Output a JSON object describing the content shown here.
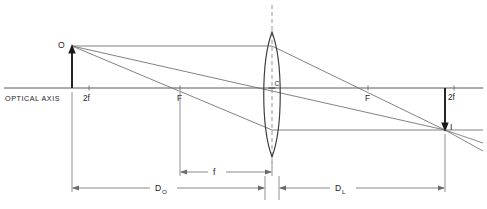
{
  "diagram": {
    "type": "optics-ray-diagram",
    "canvas": {
      "width": 487,
      "height": 209
    },
    "colors": {
      "line": "#5a5a5a",
      "ray": "#6b6b6b",
      "lens_outline": "#3a3a3a",
      "arrow_solid": "#1a1a1a",
      "dashed": "#8a8a8a",
      "text": "#222222",
      "background": "#ffffff"
    },
    "axis": {
      "label": "OPTICAL AXIS",
      "y": 88,
      "x_start": 4,
      "x_end": 483
    },
    "marks": [
      {
        "name": "two-f-left",
        "label": "2f",
        "x": 87,
        "side": "left"
      },
      {
        "name": "focal-left",
        "label": "F",
        "x": 180,
        "side": "left"
      },
      {
        "name": "center",
        "label": "C",
        "x": 272,
        "side": "lens"
      },
      {
        "name": "focal-right",
        "label": "F",
        "x": 368,
        "side": "right"
      },
      {
        "name": "two-f-right",
        "label": "2f",
        "x": 452,
        "side": "right"
      }
    ],
    "object": {
      "label": "O",
      "x": 72,
      "tip_y": 46,
      "base_y": 88,
      "direction": "up"
    },
    "image": {
      "label": "I",
      "x": 445,
      "tip_y": 130,
      "base_y": 88,
      "direction": "down"
    },
    "lens": {
      "center_x": 272,
      "top_y": 32,
      "bottom_y": 157,
      "half_width": 10,
      "type": "biconvex",
      "center_label": "C"
    },
    "dimensions": [
      {
        "name": "focal-length",
        "label": "f",
        "subscript": "",
        "x_from": 180,
        "x_to": 272,
        "y": 172
      },
      {
        "name": "object-distance",
        "label": "D",
        "subscript": "O",
        "x_from": 72,
        "x_to": 272,
        "y": 188
      },
      {
        "name": "image-distance",
        "label": "D",
        "subscript": "L",
        "x_from": 272,
        "x_to": 445,
        "y": 188
      }
    ],
    "rays": [
      {
        "name": "parallel-ray-in",
        "from": [
          72,
          46
        ],
        "to": [
          272,
          46
        ]
      },
      {
        "name": "parallel-ray-out",
        "from": [
          272,
          46
        ],
        "to": [
          445,
          130
        ]
      },
      {
        "name": "center-ray",
        "from": [
          72,
          46
        ],
        "to": [
          445,
          130
        ]
      },
      {
        "name": "focal-ray-in",
        "from": [
          72,
          46
        ],
        "to": [
          272,
          130
        ]
      },
      {
        "name": "focal-ray-out",
        "from": [
          272,
          130
        ],
        "to": [
          483,
          130
        ]
      },
      {
        "name": "extension-ray-1",
        "from": [
          445,
          130
        ],
        "to": [
          483,
          143
        ]
      },
      {
        "name": "extension-ray-2",
        "from": [
          445,
          130
        ],
        "to": [
          483,
          150
        ]
      }
    ]
  }
}
